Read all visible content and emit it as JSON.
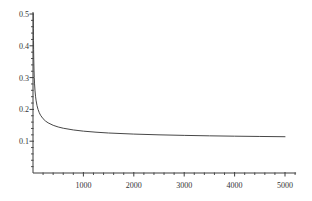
{
  "chart_data": {
    "type": "line",
    "title": "",
    "xlabel": "",
    "ylabel": "",
    "xlim": [
      0,
      5200
    ],
    "ylim": [
      0,
      0.5
    ],
    "x_ticks_major": [
      1000,
      2000,
      3000,
      4000,
      5000
    ],
    "x_tick_labels": [
      "1000",
      "2000",
      "3000",
      "4000",
      "5000"
    ],
    "x_minor_tick_step": 200,
    "y_ticks_major": [
      0.1,
      0.2,
      0.3,
      0.4,
      0.5
    ],
    "y_tick_labels": [
      "0.1",
      "0.2",
      "0.3",
      "0.4",
      "0.5"
    ],
    "y_minor_tick_step": 0.02,
    "grid": false,
    "legend_position": "none",
    "background_color": "#ffffff",
    "axis_color": "#3d3d3d",
    "curve_color": "#474747",
    "label_color": "#333333",
    "series": [
      {
        "name": "decaying-curve",
        "x": [
          6.25,
          7,
          8,
          9,
          10,
          12,
          15,
          20,
          25,
          30,
          40,
          50,
          60,
          80,
          100,
          125,
          150,
          200,
          250,
          300,
          400,
          500,
          600,
          800,
          1000,
          1250,
          1500,
          2000,
          2500,
          3000,
          3500,
          4000,
          4500,
          5000
        ],
        "y": [
          0.5,
          0.478,
          0.4536,
          0.4333,
          0.4162,
          0.3887,
          0.3582,
          0.3236,
          0.3,
          0.2826,
          0.2581,
          0.2414,
          0.2291,
          0.2118,
          0.2,
          0.1894,
          0.1816,
          0.1707,
          0.1632,
          0.1577,
          0.15,
          0.1447,
          0.1408,
          0.1354,
          0.1316,
          0.1283,
          0.1258,
          0.1224,
          0.12,
          0.1183,
          0.1169,
          0.1158,
          0.1149,
          0.1141
        ]
      }
    ]
  }
}
